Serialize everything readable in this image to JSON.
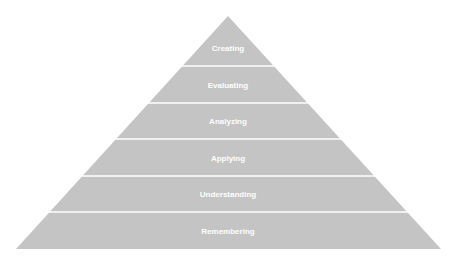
{
  "diagram": {
    "type": "pyramid",
    "title": "",
    "fill_color": "#c4c4c4",
    "separator_color": "#ffffff",
    "text_color": "#ffffff",
    "levels_top_to_bottom": [
      {
        "label": "Creating"
      },
      {
        "label": "Evaluating"
      },
      {
        "label": "Analyzing"
      },
      {
        "label": "Applying"
      },
      {
        "label": "Understanding"
      },
      {
        "label": "Remembering"
      }
    ]
  }
}
